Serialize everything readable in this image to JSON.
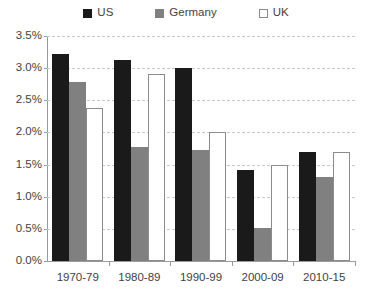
{
  "chart_data": {
    "type": "bar",
    "title": "",
    "subtitle": "",
    "xlabel": "",
    "ylabel": "",
    "categories": [
      "1970-79",
      "1980-89",
      "1990-99",
      "2000-09",
      "2010-15"
    ],
    "series": [
      {
        "name": "US",
        "values": [
          3.22,
          3.12,
          3.01,
          1.42,
          1.7
        ],
        "color": "#1a1a1a"
      },
      {
        "name": "Germany",
        "values": [
          2.78,
          1.78,
          1.73,
          0.51,
          1.3
        ],
        "color": "#808080"
      },
      {
        "name": "UK",
        "values": [
          2.38,
          2.91,
          2.0,
          1.5,
          1.7
        ],
        "color": "#ffffff"
      }
    ],
    "ylim": [
      0.0,
      3.5
    ],
    "ytick_values": [
      0.0,
      0.5,
      1.0,
      1.5,
      2.0,
      2.5,
      3.0,
      3.5
    ],
    "ytick_labels": [
      "0.0%",
      "0.5%",
      "1.0%",
      "1.5%",
      "2.0%",
      "2.5%",
      "3.0%",
      "3.5%"
    ],
    "grid": true,
    "grid_style": "dashed-horizontal",
    "legend_position": "top-center",
    "legend_entries": [
      {
        "label": "US",
        "swatch": "filled-black-square"
      },
      {
        "label": "Germany",
        "swatch": "filled-gray-square"
      },
      {
        "label": "UK",
        "swatch": "outlined-white-square"
      }
    ]
  },
  "colors": {
    "us": "#1a1a1a",
    "germany": "#808080",
    "uk_fill": "#ffffff",
    "uk_border": "#8c8c8c",
    "gridline": "#c9c9c9",
    "axis": "#9a9a9a",
    "text": "#3f3f3f",
    "background": "#ffffff"
  }
}
